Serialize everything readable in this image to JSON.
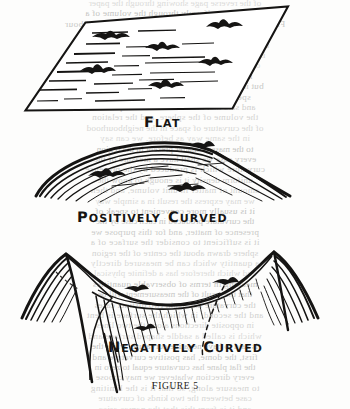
{
  "figure": {
    "label_prefix": "F",
    "label_word": "IGURE",
    "label_number": "5",
    "label_full": "FIGURE 5"
  },
  "captions": [
    {
      "id": "flat",
      "text": "FLAT",
      "lead": "F",
      "rest": "LAT",
      "words": [
        {
          "lead": "F",
          "rest": "LAT"
        }
      ]
    },
    {
      "id": "positively-curved",
      "text": "POSITIVELY CURVED",
      "words": [
        {
          "lead": "P",
          "rest": "OSITIVELY"
        },
        {
          "lead": "C",
          "rest": "URVED"
        }
      ]
    },
    {
      "id": "negatively-curved",
      "text": "NEGATIVELY CURVED",
      "words": [
        {
          "lead": "N",
          "rest": "EGATIVELY"
        },
        {
          "lead": "C",
          "rest": "URVED"
        }
      ]
    }
  ],
  "panels": [
    {
      "name": "flat-surface",
      "caption": "FLAT",
      "shape": "parallelogram"
    },
    {
      "name": "positively-curved-surface",
      "caption": "POSITIVELY CURVED",
      "shape": "dome"
    },
    {
      "name": "negatively-curved-surface",
      "caption": "NEGATIVELY CURVED",
      "shape": "saddle"
    }
  ],
  "colors": {
    "ink": "#151413",
    "paper": "#fdfdfc",
    "ghost_text": "#c0bfbd"
  },
  "ghost_text_lines": [
    "of the reverse page showing through the paper",
    "the density uniformly through the volume of a",
    "Fig 5 shows. The straight lines in the figure neighbour",
    "is the most striking consequence. It is at the same",
    "the curvature it must therefore be in every case",
    "is one and the same thing to speak of the size of",
    "of a quantity of matter contained in a given",
    "in the case of uniform density the volume",
    "but it can be shown that the same result holds",
    "speak of the curvature of space in the",
    "and said that the amount of matter present",
    "the volume of the sphere, and the relation",
    "of the curvature of space in the neighbourhood",
    "in the same way as before, we can say",
    "to the mass of matter present in the region",
    "every case we shall have a measure of the",
    "curvature which is produced by the presence",
    "uniform density it is enough to know the",
    "amount of matter in unit volume, and then",
    "we may express the result in a simple way",
    "it is usually more convenient to speak of",
    "the curvature produced in each case by the",
    "presence of matter, and for this purpose we",
    "it is sufficient to consider the surface of a",
    "sphere drawn about the centre of the region",
    "a quantity which can be measured directly",
    "and which therefore has a definite physical",
    "meaning in terms of observable quantities",
    "that the result of the measurement will be",
    "the curvature has again two distinct cases",
    "and the second, in which the surface is bent",
    "in opposite directions along the two lines",
    "which is called a saddle shaped surface and",
    "is said to have negative curvature, while the",
    "first, the dome, has positive curvature and",
    "the flat plane has curvature equal to zero in",
    "every direction whatever we may choose",
    "to measure along, so that it is the limiting",
    "case between the two kinds of curvature",
    "and it is from this that the names arise",
    "as the following figure will make clear"
  ]
}
